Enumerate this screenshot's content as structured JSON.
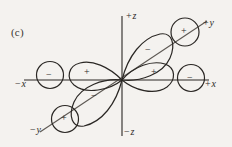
{
  "figure": {
    "panel_label": "(c)",
    "background_color": "#f4f2ef",
    "stroke_color": "#2a2724"
  },
  "axes": {
    "z_positive": {
      "prefix": "+",
      "name": "z"
    },
    "z_negative": {
      "prefix": "−",
      "name": "z"
    },
    "x_positive": {
      "prefix": "+",
      "name": "x"
    },
    "x_negative": {
      "prefix": "−",
      "name": "x"
    },
    "y_positive": {
      "prefix": "+",
      "name": "y"
    },
    "y_negative": {
      "prefix": "−",
      "name": "y"
    }
  },
  "lobe_signs": {
    "upper_right_diagonal": "−",
    "lower_left_diagonal": "−",
    "left_horizontal": "+",
    "right_horizontal": "+"
  },
  "circle_signs": {
    "far_left_on_minus_x": "−",
    "far_right_on_plus_x": "−",
    "upper_right_on_plus_y": "+",
    "lower_left_on_minus_y": "+"
  }
}
